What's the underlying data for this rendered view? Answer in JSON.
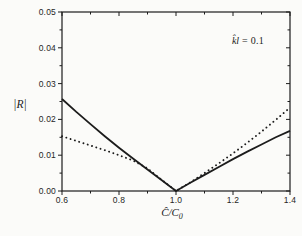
{
  "figure": {
    "background": "#fbfbf9",
    "line_color": "#1c1c1c",
    "y_axis": {
      "label": "|R|"
    },
    "x_axis": {
      "label_main": "Ĉ/C",
      "label_sub": "0"
    },
    "annotation": {
      "symbol": "k̂l",
      "rest": " = 0.1"
    }
  },
  "chart_data": {
    "type": "line",
    "title": "",
    "xlabel": "Ĉ/C₀",
    "ylabel": "|R|",
    "annotation": "k̂l = 0.1",
    "xlim": [
      0.6,
      1.4
    ],
    "ylim": [
      0,
      0.05
    ],
    "grid": false,
    "legend": "none",
    "x_major_ticks": [
      0.6,
      0.8,
      1.0,
      1.2,
      1.4
    ],
    "x_major_tick_labels": [
      "0.6",
      "0.8",
      "1.0",
      "1.2",
      "1.4"
    ],
    "x_minor_ticks": [
      0.7,
      0.9,
      1.1,
      1.3
    ],
    "y_major_ticks": [
      0,
      0.01,
      0.02,
      0.03,
      0.04,
      0.05
    ],
    "y_major_tick_labels": [
      "0.00",
      "0.01",
      "0.02",
      "0.03",
      "0.04",
      "0.05"
    ],
    "y_minor_ticks": [
      0.005,
      0.015,
      0.025,
      0.035,
      0.045
    ],
    "series": [
      {
        "name": "solid-curve",
        "style": "solid",
        "x": [
          0.6,
          0.65,
          0.7,
          0.75,
          0.8,
          0.85,
          0.9,
          0.95,
          1.0,
          1.05,
          1.1,
          1.15,
          1.2,
          1.25,
          1.3,
          1.35,
          1.4
        ],
        "y": [
          0.0257,
          0.0221,
          0.0187,
          0.0153,
          0.0121,
          0.009,
          0.006,
          0.003,
          0.0,
          0.0023,
          0.0045,
          0.0067,
          0.0089,
          0.011,
          0.013,
          0.015,
          0.0168
        ]
      },
      {
        "name": "dotted-curve",
        "style": "dotted",
        "x": [
          0.6,
          0.65,
          0.7,
          0.75,
          0.8,
          0.85,
          0.9,
          0.95,
          1.0,
          1.05,
          1.1,
          1.15,
          1.2,
          1.25,
          1.3,
          1.35,
          1.4
        ],
        "y": [
          0.0153,
          0.014,
          0.0127,
          0.0114,
          0.01,
          0.0085,
          0.0063,
          0.0031,
          0.0,
          0.0024,
          0.005,
          0.0077,
          0.0105,
          0.0135,
          0.0166,
          0.0199,
          0.0233
        ]
      }
    ]
  }
}
